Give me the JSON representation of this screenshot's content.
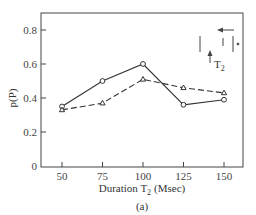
{
  "chart_data": {
    "type": "line",
    "title": "",
    "xlabel": "Duration T2 (Msec)",
    "xlabel_main": "Duration T",
    "xlabel_sub": "2",
    "xlabel_unit": "(Msec)",
    "ylabel": "p(P)",
    "caption": "(a)",
    "x": [
      50,
      75,
      100,
      125,
      150
    ],
    "xticks": [
      "50",
      "75",
      "100",
      "125",
      "150"
    ],
    "yticks": [
      "0",
      "0.2",
      "0.4",
      "0.6",
      "0.8"
    ],
    "xlim": [
      38,
      162
    ],
    "ylim": [
      0,
      0.9
    ],
    "grid": false,
    "series": [
      {
        "name": "solid-circles",
        "line": "solid",
        "marker": "circle",
        "values": [
          0.35,
          0.5,
          0.6,
          0.36,
          0.39
        ]
      },
      {
        "name": "dashed-triangles",
        "line": "dashed",
        "marker": "triangle",
        "values": [
          0.33,
          0.37,
          0.51,
          0.46,
          0.43
        ]
      }
    ],
    "annotations": {
      "inset_label_main": "T",
      "inset_label_sub": "2",
      "inset_desc": "pulse schematic with arrows indicating T2"
    }
  },
  "colors": {
    "line": "#333333",
    "axis": "#444444",
    "background": "#ffffff"
  }
}
